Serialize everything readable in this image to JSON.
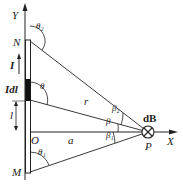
{
  "diagram": {
    "axes": {
      "y_label": "Y",
      "x_label": "X",
      "origin_label": "O"
    },
    "wire": {
      "top_label": "N",
      "bottom_label": "M",
      "current_label": "I",
      "element_label": "IdI",
      "element_label_display": "Idl"
    },
    "lengths": {
      "l_label": "l",
      "a_label": "a",
      "r_label": "r"
    },
    "angles": {
      "theta": "θ",
      "theta1": "θ₁",
      "theta2": "θ₂",
      "beta": "β",
      "beta1": "β₁",
      "beta2": "β₂"
    },
    "point": {
      "label": "P",
      "field_label": "dB",
      "field_direction": "into-page-cross"
    },
    "colors": {
      "line": "#222222",
      "background": "#ffffff"
    }
  }
}
